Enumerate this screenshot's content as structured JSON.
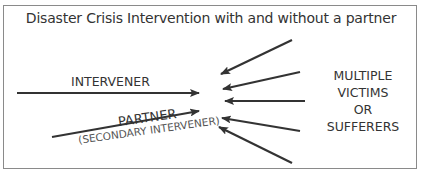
{
  "diagram": {
    "title": "Disaster Crisis Intervention with and without a partner",
    "left_nodes": [
      {
        "label": "INTERVENER"
      },
      {
        "label": "PARTNER",
        "sublabel": "(SECONDARY INTERVENER)"
      }
    ],
    "right_node": {
      "lines": [
        "MULTIPLE",
        "VICTIMS",
        "OR",
        "SUFFERERS"
      ]
    },
    "arrows": [
      {
        "from": "INTERVENER",
        "to": "center",
        "x1": 17,
        "y1": 93,
        "x2": 199,
        "y2": 93
      },
      {
        "from": "PARTNER",
        "to": "center",
        "x1": 52,
        "y1": 137,
        "x2": 199,
        "y2": 111
      },
      {
        "from": "victims",
        "to": "center",
        "x1": 292,
        "y1": 40,
        "x2": 221,
        "y2": 74
      },
      {
        "from": "victims",
        "to": "center",
        "x1": 300,
        "y1": 72,
        "x2": 223,
        "y2": 89
      },
      {
        "from": "victims",
        "to": "center",
        "x1": 305,
        "y1": 101,
        "x2": 225,
        "y2": 101
      },
      {
        "from": "victims",
        "to": "center",
        "x1": 300,
        "y1": 131,
        "x2": 222,
        "y2": 118
      },
      {
        "from": "victims",
        "to": "center",
        "x1": 292,
        "y1": 163,
        "x2": 219,
        "y2": 127
      }
    ],
    "colors": {
      "line": "#333333",
      "text": "#333333",
      "border": "#8a8a8a"
    }
  }
}
